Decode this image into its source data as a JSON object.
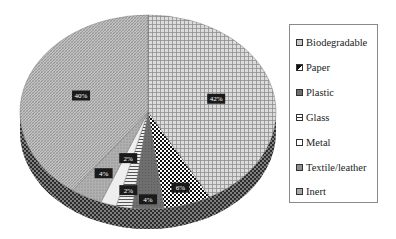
{
  "chart_data": {
    "type": "pie",
    "style": "3d-pie, monochrome hatched patterns",
    "title": "",
    "categories": [
      "Biodegradable",
      "Paper",
      "Plastic",
      "Glass",
      "Metal",
      "Textile/leather",
      "Inert"
    ],
    "values": [
      42,
      6,
      4,
      2,
      2,
      4,
      40
    ],
    "unit": "%",
    "data_labels": [
      "42%",
      "6%",
      "4%",
      "2%",
      "2%",
      "4%",
      "40%"
    ],
    "start_angle": "12 o'clock, clockwise",
    "legend_position": "right"
  },
  "legend": {
    "items": [
      {
        "label": "Biodegradable",
        "fill": "#c8c8c8"
      },
      {
        "label": "Paper",
        "fill": "#111111"
      },
      {
        "label": "Plastic",
        "fill": "#6e6e6e"
      },
      {
        "label": "Glass",
        "fill": "#9a9a9a"
      },
      {
        "label": "Metal",
        "fill": "#ffffff"
      },
      {
        "label": "Textile/leather",
        "fill": "#8e8e8e"
      },
      {
        "label": "Inert",
        "fill": "#a8a8a8"
      }
    ]
  }
}
